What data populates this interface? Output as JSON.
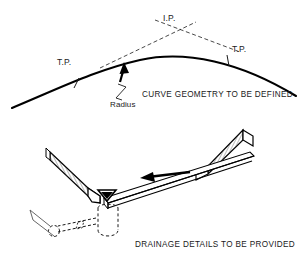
{
  "document": {
    "background_color": "#ffffff",
    "ink_color": "#000000"
  },
  "curve_diagram": {
    "name": "horizontal curve geometry sketch",
    "caption": "CURVE GEOMETRY TO BE DEFINED",
    "labels": {
      "intersection_point": "I.P.",
      "tangent_point_left": "T.P.",
      "tangent_point_right": "T.P.",
      "radius": "Radius"
    },
    "notes": {
      "tangent_style": "dashed",
      "curve_style": "solid",
      "radius_pointer": "arrow"
    }
  },
  "drainage_diagram": {
    "name": "drainage detail isometric sketch",
    "caption": "DRAINAGE DETAILS TO BE PROVIDED",
    "elements": {
      "left_panel": "hatched sloped deck panel",
      "right_panel": "hatched sloped deck panel",
      "channel": "gutter channel",
      "flow_arrow": "flow direction arrow",
      "funnel": "inlet funnel",
      "catch_basin": "catch basin",
      "pipe_run": "buried drain pipe",
      "pipe_junction": "pipe junction"
    }
  }
}
